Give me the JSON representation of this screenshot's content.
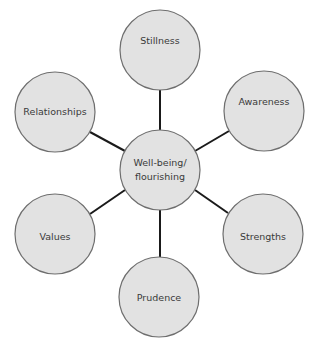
{
  "diagram": {
    "type": "hub-and-spoke",
    "colors": {
      "node_fill": "#e2e2e2",
      "node_stroke": "#6e6e6e",
      "connector": "#1a1a1a",
      "text": "#3a3a3a"
    },
    "center": {
      "id": "wellbeing",
      "lines": [
        "Well-being/",
        "flourishing"
      ]
    },
    "nodes": [
      {
        "id": "stillness",
        "label": "Stillness"
      },
      {
        "id": "awareness",
        "label": "Awareness"
      },
      {
        "id": "strengths",
        "label": "Strengths"
      },
      {
        "id": "prudence",
        "label": "Prudence"
      },
      {
        "id": "values",
        "label": "Values"
      },
      {
        "id": "relationships",
        "label": "Relationships"
      }
    ]
  }
}
